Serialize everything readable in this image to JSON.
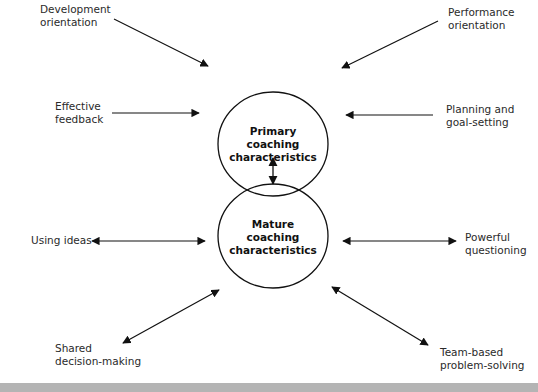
{
  "diagram": {
    "nodes": {
      "primary": {
        "lines": [
          "Primary",
          "coaching",
          "characteristics"
        ]
      },
      "mature": {
        "lines": [
          "Mature",
          "coaching",
          "characteristics"
        ]
      }
    },
    "inputs_primary": [
      {
        "lines": [
          "Development",
          "orientation"
        ],
        "arrow": "one-way into Primary"
      },
      {
        "lines": [
          "Performance",
          "orientation"
        ],
        "arrow": "one-way into Primary"
      },
      {
        "lines": [
          "Effective",
          "feedback"
        ],
        "arrow": "one-way into Primary"
      },
      {
        "lines": [
          "Planning and",
          "goal-setting"
        ],
        "arrow": "one-way into Primary"
      }
    ],
    "links_mature": [
      {
        "lines": [
          "Using ideas"
        ],
        "arrow": "two-way"
      },
      {
        "lines": [
          "Powerful",
          "questioning"
        ],
        "arrow": "two-way"
      },
      {
        "lines": [
          "Shared",
          "decision-making"
        ],
        "arrow": "two-way"
      },
      {
        "lines": [
          "Team-based",
          "problem-solving"
        ],
        "arrow": "two-way"
      }
    ],
    "center_link": "two-way between Primary and Mature",
    "colors": {
      "stroke": "#111111",
      "text": "#2a2a2a",
      "footer_bar": "#b4b4b4",
      "background": "#ffffff"
    }
  }
}
